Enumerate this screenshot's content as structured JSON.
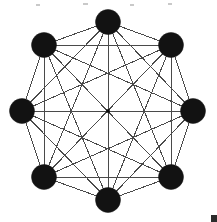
{
  "figure": {
    "background_color": "#ffffff",
    "canvas": {
      "width": 217,
      "height": 222
    }
  },
  "chart_data": {
    "type": "scatter",
    "xlabel": "",
    "ylabel": "",
    "xlim": [
      0,
      217
    ],
    "ylim": [
      0,
      222
    ],
    "grid": false,
    "legend": null,
    "graph": {
      "kind": "complete-graph",
      "vertex_count": 8,
      "edge_count": 28,
      "layout": "regular-octagon",
      "center": {
        "x": 108,
        "y": 111
      },
      "circumradius": 89,
      "vertex_radius": 12.5,
      "vertex_color": "#121212",
      "edge_color": "#4a4a4a",
      "edge_width": 1
    },
    "vertices": [
      {
        "id": 0,
        "label": "v0",
        "x": 108,
        "y": 22
      },
      {
        "id": 1,
        "label": "v1",
        "x": 171,
        "y": 45
      },
      {
        "id": 2,
        "label": "v2",
        "x": 193,
        "y": 111
      },
      {
        "id": 3,
        "label": "v3",
        "x": 171,
        "y": 177
      },
      {
        "id": 4,
        "label": "v4",
        "x": 108,
        "y": 200
      },
      {
        "id": 5,
        "label": "v5",
        "x": 44,
        "y": 177
      },
      {
        "id": 6,
        "label": "v6",
        "x": 22,
        "y": 111
      },
      {
        "id": 7,
        "label": "v7",
        "x": 44,
        "y": 45
      }
    ],
    "edges": [
      [
        0,
        1
      ],
      [
        0,
        2
      ],
      [
        0,
        3
      ],
      [
        0,
        4
      ],
      [
        0,
        5
      ],
      [
        0,
        6
      ],
      [
        0,
        7
      ],
      [
        1,
        2
      ],
      [
        1,
        3
      ],
      [
        1,
        4
      ],
      [
        1,
        5
      ],
      [
        1,
        6
      ],
      [
        1,
        7
      ],
      [
        2,
        3
      ],
      [
        2,
        4
      ],
      [
        2,
        5
      ],
      [
        2,
        6
      ],
      [
        2,
        7
      ],
      [
        3,
        4
      ],
      [
        3,
        5
      ],
      [
        3,
        6
      ],
      [
        3,
        7
      ],
      [
        4,
        5
      ],
      [
        4,
        6
      ],
      [
        4,
        7
      ],
      [
        5,
        6
      ],
      [
        5,
        7
      ],
      [
        6,
        7
      ]
    ],
    "center_marker": {
      "x": 108,
      "y": 111,
      "size": 3.5,
      "color": "#0c0c0c",
      "shape": "square"
    },
    "artifacts": [
      {
        "name": "scan-speck",
        "x": 36,
        "y": 4,
        "w": 4,
        "h": 2
      },
      {
        "name": "scan-speck",
        "x": 83,
        "y": 3,
        "w": 5,
        "h": 2
      },
      {
        "name": "scan-speck",
        "x": 130,
        "y": 4,
        "w": 4,
        "h": 2
      },
      {
        "name": "scan-speck",
        "x": 168,
        "y": 3,
        "w": 4,
        "h": 2
      },
      {
        "name": "corner-speck",
        "x": 211,
        "y": 215,
        "w": 6,
        "h": 7
      }
    ]
  }
}
